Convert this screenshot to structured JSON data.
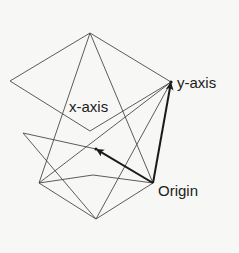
{
  "diagram": {
    "labels": {
      "x_axis": "x-axis",
      "y_axis": "y-axis",
      "origin": "Origin"
    },
    "points": {
      "top": [
        90,
        33
      ],
      "left": [
        10,
        81
      ],
      "y_axis": [
        171,
        82
      ],
      "lower_diamond": [
        90,
        131
      ],
      "left_upper": [
        23,
        133
      ],
      "inner_dot": [
        96,
        149
      ],
      "left_lower": [
        39,
        183
      ],
      "mid_low": [
        93,
        175
      ],
      "origin": [
        153,
        183
      ],
      "bottom": [
        96,
        219
      ]
    },
    "thin_lines": [
      [
        "top",
        "left"
      ],
      [
        "top",
        "y_axis"
      ],
      [
        "left",
        "lower_diamond"
      ],
      [
        "lower_diamond",
        "y_axis"
      ],
      [
        "top",
        "left_lower"
      ],
      [
        "top",
        "origin"
      ],
      [
        "left_upper",
        "inner_dot"
      ],
      [
        "left_upper",
        "bottom"
      ],
      [
        "left_lower",
        "y_axis"
      ],
      [
        "left_lower",
        "mid_low"
      ],
      [
        "mid_low",
        "origin"
      ],
      [
        "left_lower",
        "bottom"
      ],
      [
        "bottom",
        "y_axis"
      ],
      [
        "bottom",
        "origin"
      ]
    ],
    "arrows": [
      [
        "origin",
        "y_axis"
      ],
      [
        "origin",
        "inner_dot"
      ]
    ],
    "colors": {
      "line": "#4a4a4a",
      "arrow": "#1a1a1a",
      "background": "#f7f7f5"
    }
  }
}
